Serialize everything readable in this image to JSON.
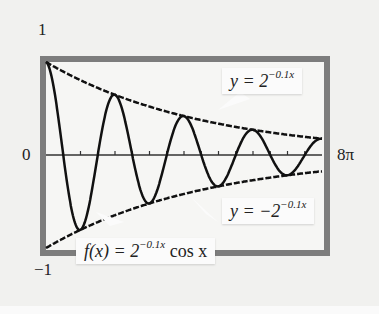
{
  "chart_data": {
    "type": "line",
    "title": "",
    "xlabel": "",
    "ylabel": "",
    "xlim": [
      0,
      25.1327
    ],
    "ylim": [
      -1,
      1
    ],
    "x_tick_labels": {
      "left": "0",
      "right": "8π"
    },
    "y_tick_labels": {
      "top": "1",
      "bottom": "-1"
    },
    "x_ticks_count": 16,
    "grid": false,
    "series": [
      {
        "name": "f(x) = 2^(-0.1x) cos x",
        "expression": "2^(-0.1x)*cos(x)"
      },
      {
        "name": "y = 2^(-0.1x)",
        "expression": "2^(-0.1x)"
      },
      {
        "name": "y = -2^(-0.1x)",
        "expression": "-2^(-0.1x)"
      }
    ],
    "annotations": [
      {
        "text": "y = 2^(-0.1x)",
        "target": "upper envelope"
      },
      {
        "text": "y = -2^(-0.1x)",
        "target": "lower envelope"
      },
      {
        "text": "f(x) = 2^(-0.1x) cos x",
        "target": "damped cosine"
      }
    ]
  },
  "labels": {
    "y_top": "1",
    "y_bottom": "−1",
    "x_left": "0",
    "x_right": "8π"
  },
  "callouts": {
    "upper": {
      "lhs": "y = 2",
      "exp": "−0.1x"
    },
    "lower": {
      "lhs": "y = −2",
      "exp": "−0.1x"
    },
    "func": {
      "lhs": "f(x) = 2",
      "exp": "−0.1x",
      "rhs": " cos x"
    }
  }
}
